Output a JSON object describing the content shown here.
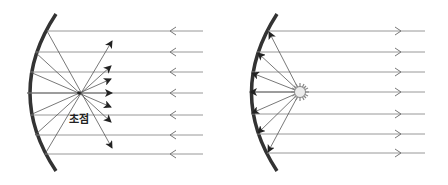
{
  "diagrams": [
    {
      "name": "converging-mirror",
      "label": "초점",
      "description": "Parallel rays reflect off concave mirror and pass through focus"
    },
    {
      "name": "light-source-at-focus",
      "description": "Light source at focus reflects off concave mirror into parallel rays"
    }
  ],
  "colors": {
    "mirror": "#333333",
    "ray": "#8a8a8a",
    "arrow": "#222222",
    "lamp": "#e6e6e6"
  }
}
